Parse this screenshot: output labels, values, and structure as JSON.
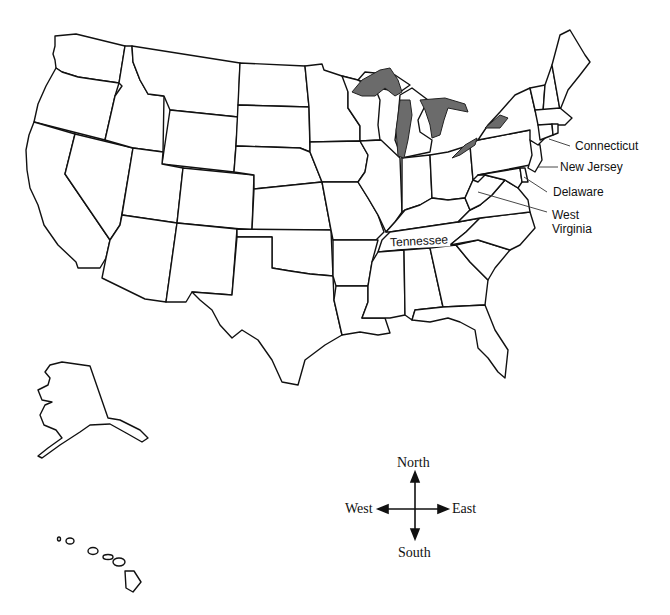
{
  "map": {
    "title": "United States",
    "state_labels": {
      "connecticut": "Connecticut",
      "new_jersey": "New Jersey",
      "delaware": "Delaware",
      "west_virginia_line1": "West",
      "west_virginia_line2": "Virginia",
      "tennessee": "Tennessee"
    },
    "highlighted_features": [
      "Great Lakes"
    ],
    "colors": {
      "state_fill": "#ffffff",
      "border": "#111111",
      "lakes": "#6b6b6b",
      "background": "#ffffff"
    }
  },
  "compass": {
    "north": "North",
    "south": "South",
    "east": "East",
    "west": "West"
  }
}
